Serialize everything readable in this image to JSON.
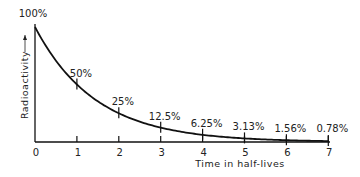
{
  "chart_data": {
    "type": "line",
    "title": "",
    "xlabel": "Time in half-lives",
    "ylabel": "Radioactivity",
    "x": [
      0,
      1,
      2,
      3,
      4,
      5,
      6,
      7
    ],
    "values": [
      100,
      50,
      25,
      12.5,
      6.25,
      3.13,
      1.56,
      0.78
    ],
    "point_labels": [
      "100%",
      "50%",
      "25%",
      "12.5%",
      "6.25%",
      "3.13%",
      "1.56%",
      "0.78%"
    ],
    "x_ticks": [
      "0",
      "1",
      "2",
      "3",
      "4",
      "5",
      "6",
      "7"
    ],
    "xlim": [
      0,
      7
    ],
    "ylim": [
      0,
      100
    ],
    "grid": false,
    "legend": null
  },
  "colors": {
    "line": "#111111",
    "axis": "#111111",
    "text": "#222222",
    "background": "#ffffff"
  }
}
